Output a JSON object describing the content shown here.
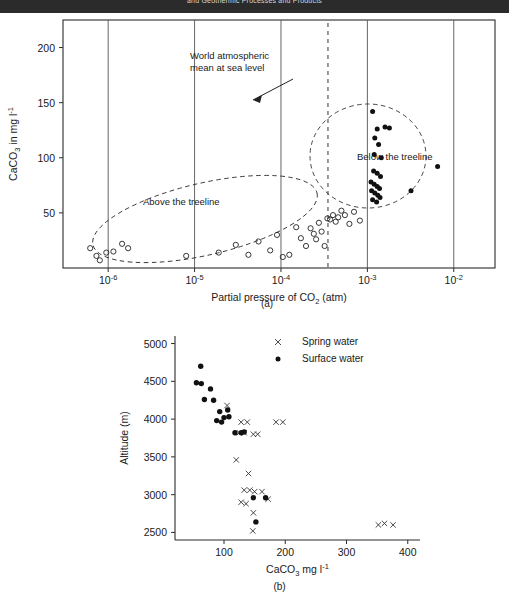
{
  "header": {
    "title": "and Geothermic Processes and Products"
  },
  "panels": [
    {
      "id": "a",
      "label": "(a)",
      "xlabel_parts": [
        "Partial pressure of CO",
        "2",
        " (atm)"
      ],
      "ylabel_parts": [
        "CaCO",
        "3",
        " in mg l",
        "-1"
      ],
      "annotations": [
        {
          "name": "world-mean-label",
          "line1": "World atmospheric",
          "line2": "mean at sea level"
        },
        {
          "name": "above-treeline-label",
          "text": "Above the treeline"
        },
        {
          "name": "below-treeline-label",
          "text": "Below the treeline"
        }
      ]
    },
    {
      "id": "b",
      "label": "(b)",
      "xlabel_parts": [
        "CaCO",
        "3",
        " mg l",
        "-1"
      ],
      "ylabel": "Altitude (m)",
      "legend": [
        {
          "marker": "x-marker",
          "label": "Spring water"
        },
        {
          "marker": "dot-marker",
          "label": "Surface water"
        }
      ]
    }
  ],
  "chart_data": [
    {
      "type": "scatter",
      "panel": "(a)",
      "title": "",
      "xlabel": "Partial pressure of CO2 (atm)",
      "ylabel": "CaCO3 in mg l-1",
      "xscale": "log",
      "xlim": [
        3e-07,
        0.03
      ],
      "ylim": [
        0,
        225
      ],
      "xticks": [
        1e-06,
        1e-05,
        0.0001,
        0.001,
        0.01
      ],
      "xticklabels": [
        "10-6",
        "10-5",
        "10-4",
        "10-3",
        "10-2"
      ],
      "yticks": [
        50,
        100,
        150,
        200
      ],
      "grid": "vertical-solid-at-decades",
      "reference_line": {
        "name": "world-atmospheric-mean",
        "x": 0.00035,
        "style": "dashed-vertical",
        "label": "World atmospheric mean at sea level"
      },
      "series": [
        {
          "name": "Spring water (open circles)",
          "marker": "open-circle",
          "points": [
            [
              6.2e-07,
              18
            ],
            [
              7.3e-07,
              11
            ],
            [
              8e-07,
              7
            ],
            [
              9.5e-07,
              14
            ],
            [
              1.15e-06,
              15
            ],
            [
              1.45e-06,
              22
            ],
            [
              1.7e-06,
              18
            ],
            [
              8e-06,
              11
            ],
            [
              1.9e-05,
              14
            ],
            [
              3e-05,
              21
            ],
            [
              4.2e-05,
              12
            ],
            [
              5.5e-05,
              24
            ],
            [
              7.5e-05,
              16
            ],
            [
              9e-05,
              30
            ],
            [
              0.000105,
              10
            ],
            [
              0.000125,
              12
            ],
            [
              0.00015,
              37
            ],
            [
              0.00017,
              27
            ],
            [
              0.000195,
              20
            ],
            [
              0.00022,
              36
            ],
            [
              0.00024,
              31
            ],
            [
              0.000255,
              26
            ],
            [
              0.000275,
              41
            ],
            [
              0.000295,
              33
            ],
            [
              0.00032,
              20
            ],
            [
              0.000345,
              45
            ],
            [
              0.00037,
              44
            ],
            [
              0.0004,
              48
            ],
            [
              0.00043,
              42
            ],
            [
              0.00046,
              46
            ],
            [
              0.0005,
              52
            ],
            [
              0.00055,
              48
            ],
            [
              0.00062,
              40
            ],
            [
              0.0007,
              51
            ],
            [
              0.00082,
              43
            ]
          ]
        },
        {
          "name": "Surface water (filled circles)",
          "marker": "filled-circle",
          "points": [
            [
              0.00115,
              142
            ],
            [
              0.0013,
              126
            ],
            [
              0.00122,
              118
            ],
            [
              0.00135,
              112
            ],
            [
              0.0016,
              128
            ],
            [
              0.0018,
              127
            ],
            [
              0.0012,
              103
            ],
            [
              0.00145,
              100
            ],
            [
              0.00118,
              88
            ],
            [
              0.0013,
              86
            ],
            [
              0.00142,
              83
            ],
            [
              0.0011,
              78
            ],
            [
              0.0012,
              76
            ],
            [
              0.0013,
              74
            ],
            [
              0.00138,
              72
            ],
            [
              0.00112,
              70
            ],
            [
              0.00122,
              68
            ],
            [
              0.00132,
              66
            ],
            [
              0.00115,
              62
            ],
            [
              0.00128,
              60
            ],
            [
              0.0014,
              64
            ],
            [
              0.0032,
              70
            ],
            [
              0.0065,
              92
            ]
          ]
        }
      ],
      "clusters": [
        {
          "name": "above-the-treeline",
          "label": "Above the treeline",
          "shape": "dashed-ellipse"
        },
        {
          "name": "below-the-treeline",
          "label": "Below the treeline",
          "shape": "dashed-ellipse"
        }
      ]
    },
    {
      "type": "scatter",
      "panel": "(b)",
      "title": "",
      "xlabel": "CaCO3 mg l-1",
      "ylabel": "Altitude (m)",
      "xlim": [
        20,
        420
      ],
      "ylim": [
        2400,
        5100
      ],
      "xticks": [
        100,
        200,
        300,
        400
      ],
      "yticks": [
        2500,
        3000,
        3500,
        4000,
        4500,
        5000
      ],
      "legend_position": "upper-right",
      "series": [
        {
          "name": "Spring water",
          "marker": "x",
          "points": [
            [
              105,
              4180
            ],
            [
              128,
              3960
            ],
            [
              138,
              3960
            ],
            [
              185,
              3960
            ],
            [
              196,
              3960
            ],
            [
              125,
              3820
            ],
            [
              133,
              3820
            ],
            [
              148,
              3800
            ],
            [
              155,
              3800
            ],
            [
              120,
              3460
            ],
            [
              140,
              3280
            ],
            [
              133,
              3060
            ],
            [
              142,
              3060
            ],
            [
              150,
              3040
            ],
            [
              162,
              3040
            ],
            [
              128,
              2900
            ],
            [
              136,
              2880
            ],
            [
              172,
              2940
            ],
            [
              148,
              2760
            ],
            [
              147,
              2520
            ],
            [
              352,
              2600
            ],
            [
              362,
              2620
            ],
            [
              376,
              2600
            ]
          ]
        },
        {
          "name": "Surface water",
          "marker": "filled-circle",
          "points": [
            [
              62,
              4700
            ],
            [
              55,
              4480
            ],
            [
              63,
              4470
            ],
            [
              78,
              4400
            ],
            [
              68,
              4260
            ],
            [
              83,
              4250
            ],
            [
              93,
              4100
            ],
            [
              106,
              4120
            ],
            [
              100,
              4020
            ],
            [
              108,
              4030
            ],
            [
              88,
              3980
            ],
            [
              96,
              3960
            ],
            [
              118,
              3820
            ],
            [
              128,
              3820
            ],
            [
              133,
              3830
            ],
            [
              148,
              2960
            ],
            [
              168,
              2960
            ],
            [
              152,
              2640
            ]
          ]
        }
      ]
    }
  ]
}
